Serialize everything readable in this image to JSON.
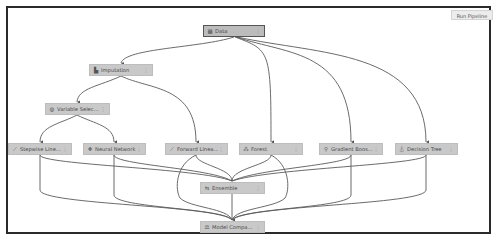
{
  "toolbar": {
    "run_pipeline_label": "Run Pipeline"
  },
  "nodes": {
    "data": {
      "label": "Data",
      "icon": "table-icon",
      "glyph": "▦",
      "menu": "⋮"
    },
    "imputation": {
      "label": "Imputation",
      "icon": "imputation-icon",
      "glyph": "▙",
      "menu": "⋮"
    },
    "variable_selection": {
      "label": "Variable Selec...",
      "icon": "variable-selection-icon",
      "glyph": "◍",
      "menu": "⋮"
    },
    "stepwise_linear": {
      "label": "Stepwise Line...",
      "icon": "line-chart-icon",
      "glyph": "⟋",
      "menu": "⋮"
    },
    "neural_network": {
      "label": "Neural Network",
      "icon": "neural-network-icon",
      "glyph": "✥",
      "menu": "⋮"
    },
    "forward_linear": {
      "label": "Forward Linea...",
      "icon": "line-chart-icon",
      "glyph": "⟋",
      "menu": "⋮"
    },
    "forest": {
      "label": "Forest",
      "icon": "forest-icon",
      "glyph": "⁂",
      "menu": "⋮"
    },
    "gradient_boosting": {
      "label": "Gradient Boos...",
      "icon": "gradient-boosting-icon",
      "glyph": "⚲",
      "menu": "⋮"
    },
    "decision_tree": {
      "label": "Decision Tree",
      "icon": "decision-tree-icon",
      "glyph": "⏃",
      "menu": "⋮"
    },
    "ensemble": {
      "label": "Ensemble",
      "icon": "ensemble-icon",
      "glyph": "⇆",
      "menu": "⋮"
    },
    "model_comparison": {
      "label": "Model Compa...",
      "icon": "model-comparison-icon",
      "glyph": "⚖",
      "menu": "⋮"
    }
  },
  "edges": [
    [
      "Data",
      "Imputation"
    ],
    [
      "Data",
      "Forest"
    ],
    [
      "Data",
      "Gradient Boos..."
    ],
    [
      "Data",
      "Decision Tree"
    ],
    [
      "Imputation",
      "Variable Selec..."
    ],
    [
      "Imputation",
      "Forward Linea..."
    ],
    [
      "Variable Selec...",
      "Stepwise Line..."
    ],
    [
      "Variable Selec...",
      "Neural Network"
    ],
    [
      "Stepwise Line...",
      "Ensemble"
    ],
    [
      "Neural Network",
      "Ensemble"
    ],
    [
      "Forward Linea...",
      "Ensemble"
    ],
    [
      "Forest",
      "Ensemble"
    ],
    [
      "Gradient Boos...",
      "Ensemble"
    ],
    [
      "Decision Tree",
      "Ensemble"
    ],
    [
      "Stepwise Line...",
      "Model Compa..."
    ],
    [
      "Neural Network",
      "Model Compa..."
    ],
    [
      "Forward Linea...",
      "Model Compa..."
    ],
    [
      "Forest",
      "Model Compa..."
    ],
    [
      "Gradient Boos...",
      "Model Compa..."
    ],
    [
      "Decision Tree",
      "Model Compa..."
    ],
    [
      "Ensemble",
      "Model Compa..."
    ]
  ],
  "colors": {
    "node_fill": "#c9c9c9",
    "edge": "#555555",
    "frame": "#2a2a2a"
  }
}
